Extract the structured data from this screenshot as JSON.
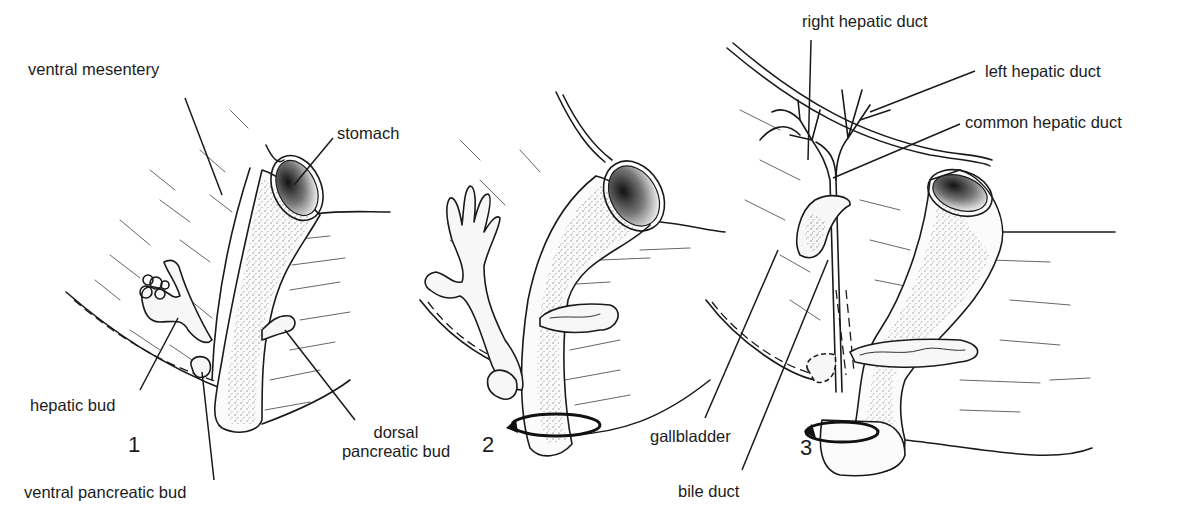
{
  "figure": {
    "stages": [
      {
        "number": "1",
        "labels": {
          "ventral_mesentery": "ventral mesentery",
          "stomach": "stomach",
          "hepatic_bud": "hepatic bud",
          "ventral_pancreatic_bud": "ventral pancreatic bud",
          "dorsal_pancreatic_bud_line1": "dorsal",
          "dorsal_pancreatic_bud_line2": "pancreatic bud"
        }
      },
      {
        "number": "2",
        "labels": {}
      },
      {
        "number": "3",
        "labels": {
          "right_hepatic_duct": "right hepatic duct",
          "left_hepatic_duct": "left hepatic duct",
          "common_hepatic_duct": "common hepatic duct",
          "gallbladder": "gallbladder",
          "bile_duct": "bile duct"
        }
      }
    ],
    "colors": {
      "ink": "#1a1a1a",
      "background": "#ffffff",
      "stipple": "#222222"
    }
  }
}
